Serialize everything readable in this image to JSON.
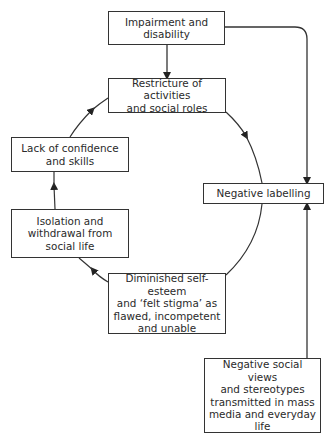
{
  "diagram": {
    "type": "cycle flowchart",
    "nodes": [
      {
        "id": "impairment",
        "label": "Impairment and\ndisability"
      },
      {
        "id": "restricture",
        "label": "Restricture of activities\nand social roles"
      },
      {
        "id": "lack",
        "label": "Lack of confidence\nand skills"
      },
      {
        "id": "isolation",
        "label": "Isolation and\nwithdrawal from\nsocial life"
      },
      {
        "id": "diminished",
        "label": "Diminished self-esteem\nand ‘felt stigma’ as\nflawed, incompetent\nand unable"
      },
      {
        "id": "labelling",
        "label": "Negative labelling"
      },
      {
        "id": "views",
        "label": "Negative social views\nand stereotypes\ntransmitted in mass\nmedia and everyday\nlife"
      }
    ],
    "edges": [
      {
        "from": "impairment",
        "to": "restricture"
      },
      {
        "from": "impairment",
        "to": "labelling"
      },
      {
        "from": "restricture",
        "to": "labelling"
      },
      {
        "from": "labelling",
        "to": "diminished"
      },
      {
        "from": "diminished",
        "to": "isolation"
      },
      {
        "from": "isolation",
        "to": "lack"
      },
      {
        "from": "lack",
        "to": "restricture"
      },
      {
        "from": "views",
        "to": "labelling"
      }
    ]
  }
}
